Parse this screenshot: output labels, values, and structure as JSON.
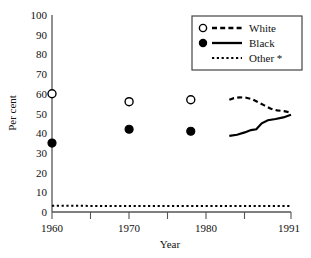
{
  "chart_data": {
    "type": "line",
    "title": "",
    "xlabel": "Year",
    "ylabel": "Per cent",
    "xlim": [
      1960,
      1991
    ],
    "ylim": [
      0,
      100
    ],
    "grid": false,
    "legend_position": "top-right",
    "y_ticks": [
      0,
      10,
      20,
      30,
      40,
      50,
      60,
      70,
      80,
      90,
      100
    ],
    "y_tick_labels": [
      "0",
      "10",
      "20",
      "30",
      "40",
      "50",
      "60",
      "70",
      "80",
      "90",
      "100"
    ],
    "x_ticks": [
      1960,
      1965,
      1970,
      1975,
      1980,
      1985,
      1991
    ],
    "x_tick_labels": [
      "1960",
      "",
      "1970",
      "",
      "1980",
      "",
      "1991"
    ],
    "series": [
      {
        "name": "White",
        "marker": "open-circle",
        "line_style": "dashed",
        "points": [
          {
            "x": 1960,
            "y": 60
          },
          {
            "x": 1970,
            "y": 56
          },
          {
            "x": 1978,
            "y": 57
          }
        ],
        "line": [
          {
            "x": 1983.0,
            "y": 57.0
          },
          {
            "x": 1983.6,
            "y": 57.8
          },
          {
            "x": 1984.4,
            "y": 58.2
          },
          {
            "x": 1985.2,
            "y": 58.0
          },
          {
            "x": 1986.0,
            "y": 57.2
          },
          {
            "x": 1986.8,
            "y": 55.6
          },
          {
            "x": 1987.6,
            "y": 54.0
          },
          {
            "x": 1988.4,
            "y": 52.4
          },
          {
            "x": 1989.2,
            "y": 51.6
          },
          {
            "x": 1990.1,
            "y": 51.2
          },
          {
            "x": 1991.0,
            "y": 50.4
          }
        ]
      },
      {
        "name": "Black",
        "marker": "filled-circle",
        "line_style": "solid",
        "points": [
          {
            "x": 1960,
            "y": 35
          },
          {
            "x": 1970,
            "y": 42
          },
          {
            "x": 1978,
            "y": 41
          }
        ],
        "line": [
          {
            "x": 1983.0,
            "y": 38.6
          },
          {
            "x": 1984.0,
            "y": 39.2
          },
          {
            "x": 1985.0,
            "y": 40.4
          },
          {
            "x": 1985.8,
            "y": 41.6
          },
          {
            "x": 1986.5,
            "y": 42.0
          },
          {
            "x": 1987.2,
            "y": 45.0
          },
          {
            "x": 1988.0,
            "y": 46.6
          },
          {
            "x": 1989.0,
            "y": 47.2
          },
          {
            "x": 1990.0,
            "y": 48.0
          },
          {
            "x": 1991.0,
            "y": 49.4
          }
        ]
      },
      {
        "name": "Other *",
        "marker": "none",
        "line_style": "dotted",
        "points": [],
        "line": [
          {
            "x": 1960,
            "y": 3.2
          },
          {
            "x": 1965,
            "y": 3.1
          },
          {
            "x": 1970,
            "y": 3.0
          },
          {
            "x": 1975,
            "y": 3.0
          },
          {
            "x": 1980,
            "y": 3.0
          },
          {
            "x": 1985,
            "y": 3.1
          },
          {
            "x": 1991,
            "y": 3.0
          }
        ]
      }
    ],
    "legend_entries": [
      {
        "label": "White",
        "marker": "open-circle",
        "line_style": "dashed"
      },
      {
        "label": "Black",
        "marker": "filled-circle",
        "line_style": "solid"
      },
      {
        "label": "Other *",
        "marker": "none",
        "line_style": "dotted"
      }
    ]
  },
  "colors": {
    "ink": "#000000",
    "axis": "#555555",
    "background": "#ffffff"
  }
}
